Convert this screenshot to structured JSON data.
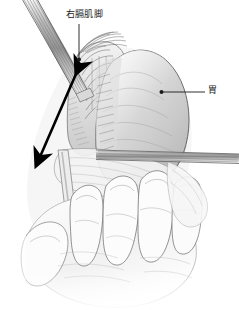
{
  "figure": {
    "width": 239,
    "height": 310,
    "background_color": "#ffffff",
    "style": "grayscale medical line drawing with stipple shading"
  },
  "labels": {
    "crus": {
      "text": "右膈肌脚",
      "meaning": "right crus of diaphragm",
      "leader": "vertical line from label down to anatomy",
      "color": "#1a1a1a"
    },
    "stomach": {
      "text": "胃",
      "meaning": "stomach",
      "leader": "horizontal line from label left to anatomy",
      "color": "#1a1a1a"
    }
  },
  "annotations": {
    "traction_arrow": {
      "name": "double-headed-traction-arrow",
      "description": "thick black double-headed arrow indicating direction of retraction",
      "color": "#000000"
    }
  },
  "anatomy": {
    "stomach_body": {
      "name": "stomach",
      "fill": "#cfcfcf",
      "outline": "#4a4a4a"
    },
    "diaphragm_crus": {
      "name": "right-crus-of-diaphragm",
      "fill": "#e2e2e2",
      "outline": "#555555"
    },
    "hand": {
      "name": "surgeon-hand",
      "fill": "#fafafa",
      "outline": "#6b6b6b"
    }
  },
  "instruments": {
    "upper_left": {
      "name": "retractor-instrument-upper-left",
      "color": "#9a9a9a"
    },
    "lower_right": {
      "name": "retractor-instrument-lower-right",
      "color": "#9a9a9a"
    },
    "vertical_probe": {
      "name": "probe-instrument-vertical",
      "color": "#bdbdbd"
    }
  },
  "colors": {
    "ink": "#1a1a1a",
    "line": "#4a4a4a",
    "light_gray": "#e8e8e8",
    "mid_gray": "#c4c4c4",
    "dark_gray": "#8a8a8a",
    "white": "#ffffff"
  }
}
